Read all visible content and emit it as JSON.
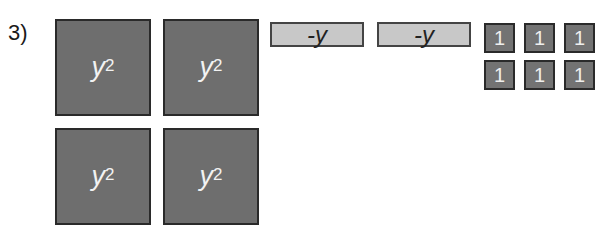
{
  "problem": {
    "number_label": "3)"
  },
  "tiles": {
    "y_squared": [
      {
        "var": "y",
        "exp": "2"
      },
      {
        "var": "y",
        "exp": "2"
      },
      {
        "var": "y",
        "exp": "2"
      },
      {
        "var": "y",
        "exp": "2"
      }
    ],
    "neg_y": [
      {
        "label": "-y"
      },
      {
        "label": "-y"
      }
    ],
    "units": [
      {
        "label": "1"
      },
      {
        "label": "1"
      },
      {
        "label": "1"
      },
      {
        "label": "1"
      },
      {
        "label": "1"
      },
      {
        "label": "1"
      }
    ]
  },
  "colors": {
    "y_squared_fill": "#6e6e6e",
    "neg_y_fill": "#c8c8c8",
    "unit_fill": "#737373"
  }
}
